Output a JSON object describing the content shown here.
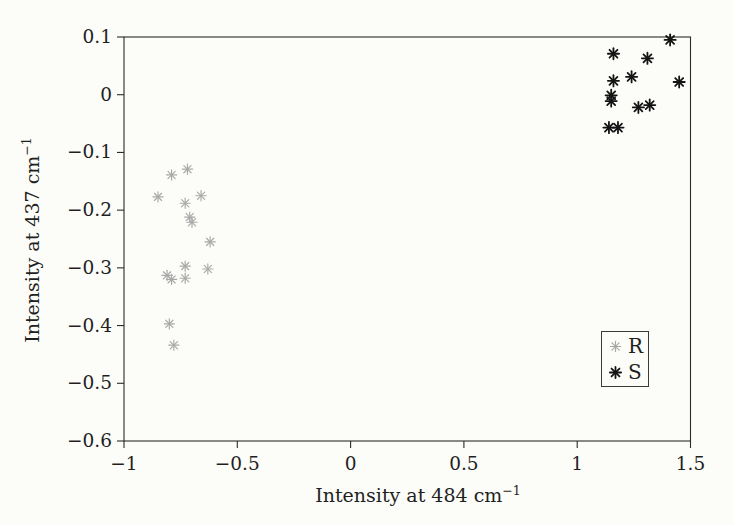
{
  "figure": {
    "background": "#fcfcf8",
    "text_color": "#1f1f1f",
    "frame_color": "#2b2b2b"
  },
  "chart_data": {
    "type": "scatter",
    "title": "",
    "xlabel": "Intensity at 484 cm⁻¹",
    "xlabel_prefix": "Intensity at 484 cm",
    "xlabel_sup": "−1",
    "ylabel": "Intensity at 437 cm⁻¹",
    "ylabel_prefix": "Intensity at 437 cm",
    "ylabel_sup": "−1",
    "xlim": [
      -1,
      1.5
    ],
    "ylim": [
      -0.6,
      0.1
    ],
    "x_ticks": [
      -1,
      -0.5,
      0,
      0.5,
      1,
      1.5
    ],
    "x_tick_labels": [
      "−1",
      "−0.5",
      "0",
      "0.5",
      "1",
      "1.5"
    ],
    "y_ticks": [
      0.1,
      0,
      -0.1,
      -0.2,
      -0.3,
      -0.4,
      -0.5,
      -0.6
    ],
    "y_tick_labels": [
      "0.1",
      "0",
      "−0.1",
      "−0.2",
      "−0.3",
      "−0.4",
      "−0.5",
      "−0.6"
    ],
    "grid": false,
    "legend_position": "lower-right-inside",
    "series": [
      {
        "name": "R",
        "marker": "asterisk-8-spoke",
        "color": "#a8a8a8",
        "points": [
          [
            -0.79,
            -0.139
          ],
          [
            -0.72,
            -0.129
          ],
          [
            -0.85,
            -0.177
          ],
          [
            -0.66,
            -0.175
          ],
          [
            -0.73,
            -0.188
          ],
          [
            -0.71,
            -0.212
          ],
          [
            -0.7,
            -0.221
          ],
          [
            -0.62,
            -0.255
          ],
          [
            -0.73,
            -0.297
          ],
          [
            -0.63,
            -0.302
          ],
          [
            -0.81,
            -0.313
          ],
          [
            -0.79,
            -0.32
          ],
          [
            -0.73,
            -0.318
          ],
          [
            -0.8,
            -0.397
          ],
          [
            -0.78,
            -0.434
          ]
        ]
      },
      {
        "name": "S",
        "marker": "asterisk-8-spoke",
        "color": "#141414",
        "points": [
          [
            1.41,
            0.095
          ],
          [
            1.16,
            0.071
          ],
          [
            1.31,
            0.063
          ],
          [
            1.24,
            0.031
          ],
          [
            1.16,
            0.024
          ],
          [
            1.45,
            0.022
          ],
          [
            1.15,
            -0.001
          ],
          [
            1.15,
            -0.011
          ],
          [
            1.32,
            -0.018
          ],
          [
            1.27,
            -0.022
          ],
          [
            1.14,
            -0.057
          ],
          [
            1.18,
            -0.057
          ]
        ]
      }
    ]
  }
}
